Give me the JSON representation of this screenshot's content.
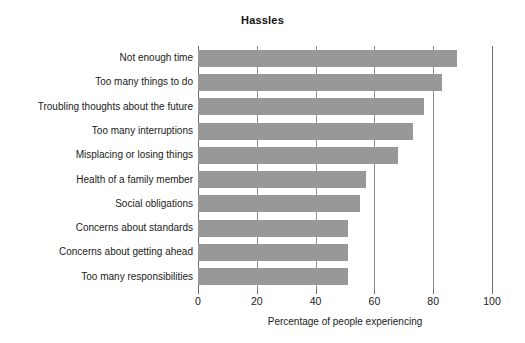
{
  "chart_data": {
    "type": "bar",
    "orientation": "horizontal",
    "title": "Hassles",
    "xlabel": "Percentage of people experiencing",
    "ylabel": "",
    "xlim": [
      0,
      100
    ],
    "xticks": [
      0,
      20,
      40,
      60,
      80,
      100
    ],
    "xtick_labels": [
      "0",
      "20",
      "40",
      "60",
      "80",
      "100"
    ],
    "grid": true,
    "grid_axis": "x",
    "legend": false,
    "bar_color": "#989898",
    "background_color": "#ffffff",
    "categories": [
      "Not enough time",
      "Too many things to do",
      "Troubling thoughts about the future",
      "Too many interruptions",
      "Misplacing or losing things",
      "Health of a family member",
      "Social obligations",
      "Concerns about standards",
      "Concerns about getting ahead",
      "Too many responsibilities"
    ],
    "values": [
      88,
      83,
      77,
      73,
      68,
      57,
      55,
      51,
      51,
      51
    ]
  }
}
